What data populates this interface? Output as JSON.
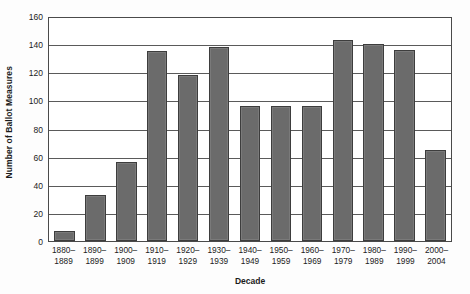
{
  "chart_data": {
    "type": "bar",
    "title": "",
    "xlabel": "Decade",
    "ylabel": "Number of Ballot Measures",
    "ylim": [
      0,
      160
    ],
    "ytick_step": 20,
    "yticks": [
      0,
      20,
      40,
      60,
      80,
      100,
      120,
      140,
      160
    ],
    "grid": true,
    "legend": "none",
    "bar_color": "#6b6b6b",
    "bar_edge_color": "#3d3d3d",
    "categories": [
      "1880–\n1889",
      "1890–\n1899",
      "1900–\n1909",
      "1910–\n1919",
      "1920–\n1929",
      "1930–\n1939",
      "1940–\n1949",
      "1950–\n1959",
      "1960–\n1969",
      "1970–\n1979",
      "1980–\n1989",
      "1990–\n1999",
      "2000–\n2004"
    ],
    "values": [
      7,
      33,
      56,
      135,
      118,
      138,
      96,
      96,
      96,
      143,
      140,
      136,
      65
    ]
  }
}
